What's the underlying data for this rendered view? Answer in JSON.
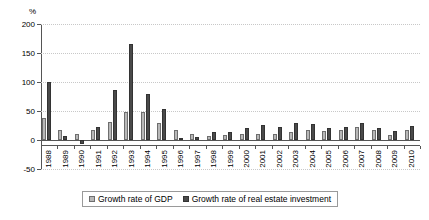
{
  "chart_data": {
    "type": "bar",
    "title": "",
    "xlabel": "",
    "ylabel": "",
    "unit_label": "%",
    "ylim": [
      -50,
      200
    ],
    "yticks": [
      -50,
      0,
      50,
      100,
      150,
      200
    ],
    "ytick_labels": [
      "-50",
      "0",
      "50",
      "100",
      "150",
      "200"
    ],
    "grid": true,
    "legend_position": "bottom",
    "categories": [
      "1988",
      "1989",
      "1990",
      "1991",
      "1992",
      "1993",
      "1994",
      "1995",
      "1996",
      "1997",
      "1998",
      "1999",
      "2000",
      "2001",
      "2002",
      "2003",
      "2004",
      "2005",
      "2006",
      "2007",
      "2008",
      "2009",
      "2010"
    ],
    "series": [
      {
        "name": "Growth rate of GDP",
        "color": "#b8b8b8",
        "values": [
          38,
          17,
          10,
          18,
          31,
          48,
          48,
          29,
          17,
          11,
          7,
          8,
          11,
          11,
          10,
          13,
          18,
          16,
          17,
          23,
          18,
          9,
          18
        ]
      },
      {
        "name": "Growth rate of real estate investment",
        "color": "#4a4a4a",
        "values": [
          100,
          7,
          -7,
          23,
          87,
          165,
          79,
          54,
          3,
          5,
          14,
          14,
          20,
          26,
          22,
          30,
          28,
          21,
          22,
          30,
          21,
          16,
          25
        ]
      }
    ]
  },
  "legend": {
    "items": [
      {
        "label": "Growth rate of GDP",
        "key": "gdp"
      },
      {
        "label": "Growth rate of real estate investment",
        "key": "rei"
      }
    ]
  }
}
